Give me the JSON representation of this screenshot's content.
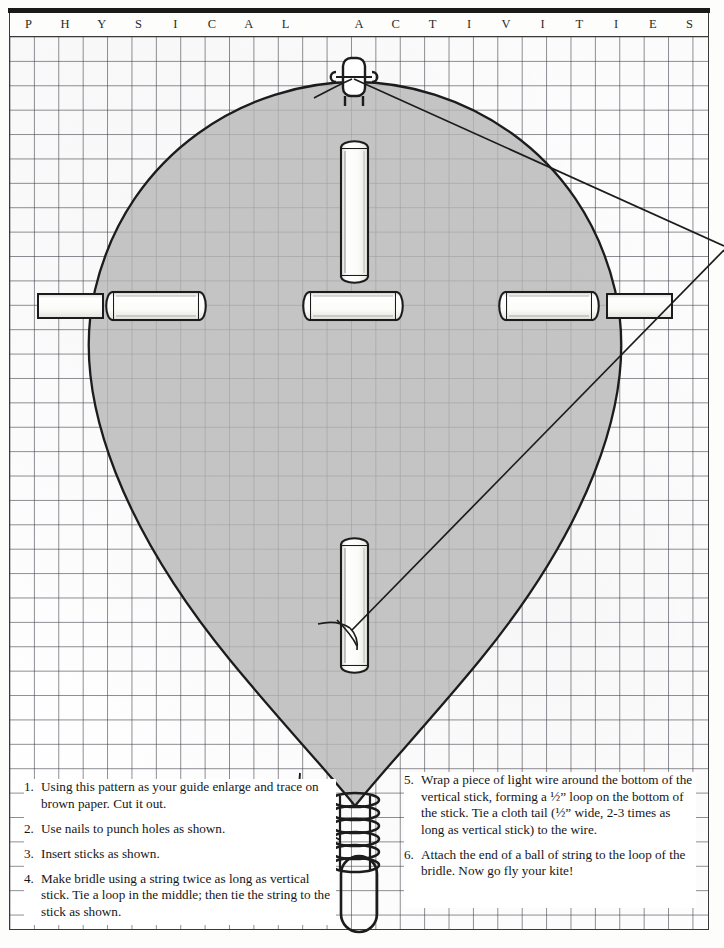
{
  "page": {
    "header_letters": [
      "P",
      "H",
      "Y",
      "S",
      "I",
      "C",
      "A",
      "L",
      "",
      "A",
      "C",
      "T",
      "I",
      "V",
      "I",
      "T",
      "I",
      "E",
      "S"
    ],
    "header_text": "PHYSICAL ACTIVITIES",
    "grid_square_px": 24,
    "colors": {
      "kite_fill": "#b6b6b6",
      "outline": "#1c1c1c",
      "grid_line": "#46464f",
      "paper": "#ffffff",
      "rule": "#1a1a1a"
    }
  },
  "diagram": {
    "kite_shape": "teardrop / pointed-oval kite sail, rounded top, V-point bottom",
    "parts": [
      {
        "name": "vertical-stick-upper",
        "label": "vertical stick (upper)"
      },
      {
        "name": "vertical-stick-lower",
        "label": "vertical stick (lower)"
      },
      {
        "name": "cross-stick-left",
        "label": "horizontal stick (left)"
      },
      {
        "name": "cross-stick-center",
        "label": "horizontal stick (center)"
      },
      {
        "name": "cross-stick-right",
        "label": "horizontal stick (right)"
      },
      {
        "name": "stub-left",
        "label": "stick end at left edge"
      },
      {
        "name": "stub-right",
        "label": "stick end at right edge"
      },
      {
        "name": "wire-coil",
        "label": "light wire wrapped around bottom of vertical stick"
      },
      {
        "name": "wire-loop",
        "label": "1/2\" wire loop at bottom of stick"
      },
      {
        "name": "bridle-string",
        "label": "bridle string"
      },
      {
        "name": "bridle-knot",
        "label": "loop knot in middle of bridle"
      }
    ]
  },
  "instructions": {
    "left_column": [
      {
        "num": "1.",
        "text": "Using this pattern as your guide enlarge and trace on brown paper. Cut it out."
      },
      {
        "num": "2.",
        "text": "Use nails to punch holes as shown."
      },
      {
        "num": "3.",
        "text": "Insert sticks as shown."
      },
      {
        "num": "4.",
        "text": "Make bridle using a string twice as long as vertical stick. Tie a loop in the middle; then tie the string to the stick as shown."
      }
    ],
    "right_column": [
      {
        "num": "5.",
        "text": "Wrap a piece of light wire around the bottom of the vertical stick, forming a ½” loop on the bottom of the stick. Tie a cloth tail (½” wide, 2-3 times as long as vertical stick) to the wire."
      },
      {
        "num": "6.",
        "text": "Attach the end of a ball of string to the loop of the bridle. Now go fly your kite!"
      }
    ]
  }
}
